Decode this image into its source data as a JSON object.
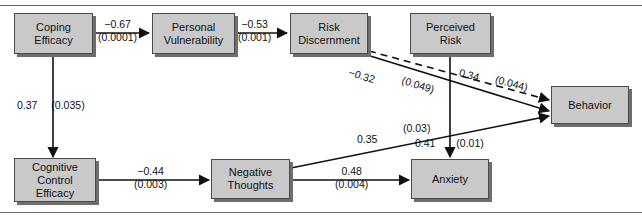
{
  "figure": {
    "kind": "path-diagram",
    "width": 642,
    "height": 221,
    "node_fill": "#c9c9c9",
    "node_border": "#4a4a4a",
    "shadow": "#6e6e6e",
    "line_color": "#111111"
  },
  "nodes": {
    "coping_efficacy": {
      "label": "Coping\nEfficacy"
    },
    "personal_vulnerability": {
      "label": "Personal\nVulnerability"
    },
    "risk_discernment": {
      "label": "Risk\nDiscernment"
    },
    "perceived_risk": {
      "label": "Perceived\nRisk"
    },
    "behavior": {
      "label": "Behavior"
    },
    "cognitive_control_efficacy": {
      "label": "Cognitive\nControl\nEfficacy"
    },
    "negative_thoughts": {
      "label": "Negative\nThoughts"
    },
    "anxiety": {
      "label": "Anxiety"
    }
  },
  "edges": {
    "coping_to_vulnerability": {
      "coef": "−0.67",
      "pval": "(0.0001)"
    },
    "vulnerability_to_discernment": {
      "coef": "−0.53",
      "pval": "(0.001)"
    },
    "coping_to_cognitive": {
      "coef": "0.37",
      "pval": "(0.035)"
    },
    "discernment_to_behavior": {
      "coef": "−0.32",
      "pval": "(0.049)"
    },
    "perceived_risk_to_behavior": {
      "coef": "0.34",
      "pval": "(0.044)"
    },
    "perceived_risk_to_anxiety": {
      "coef": "0.41",
      "pval": "(0.01)"
    },
    "cognitive_to_negative": {
      "coef": "−0.44",
      "pval": "(0.003)"
    },
    "negative_to_behavior": {
      "coef": "0.35",
      "pval": "(0.03)"
    },
    "negative_to_anxiety": {
      "coef": "0.48",
      "pval": "(0.004)"
    }
  }
}
